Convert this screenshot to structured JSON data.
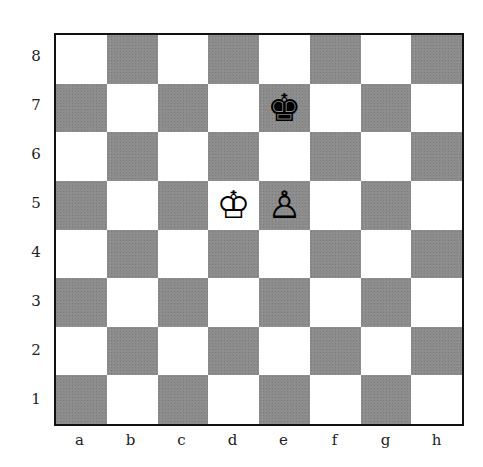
{
  "board": {
    "orientation": "white",
    "files": [
      "a",
      "b",
      "c",
      "d",
      "e",
      "f",
      "g",
      "h"
    ],
    "ranks": [
      "8",
      "7",
      "6",
      "5",
      "4",
      "3",
      "2",
      "1"
    ],
    "colors": {
      "light": "#ffffff",
      "dark": "#8c8c8c",
      "border": "#111111"
    },
    "pieces": [
      {
        "square": "e7",
        "color": "black",
        "type": "king",
        "glyph": "♚"
      },
      {
        "square": "d5",
        "color": "white",
        "type": "king",
        "glyph": "♔"
      },
      {
        "square": "e5",
        "color": "white",
        "type": "pawn",
        "glyph": "♙"
      }
    ]
  }
}
